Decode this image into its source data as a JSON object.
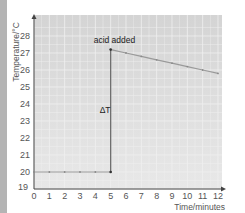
{
  "chart_data": {
    "type": "line",
    "title": "",
    "xlabel": "Time/minutes",
    "ylabel": "Temperature/°C",
    "xlim": [
      0,
      12
    ],
    "ylim": [
      19,
      28
    ],
    "x_ticks": [
      "0",
      "1",
      "2",
      "3",
      "4",
      "5",
      "6",
      "7",
      "8",
      "9",
      "10",
      "11",
      "12"
    ],
    "y_ticks": [
      "19",
      "20",
      "21",
      "22",
      "23",
      "24",
      "25",
      "26",
      "27",
      "28"
    ],
    "grid": true,
    "legend": null,
    "series": [
      {
        "name": "Temperature",
        "x": [
          0,
          1,
          2,
          3,
          4,
          5,
          5,
          6,
          7,
          8,
          9,
          10,
          11,
          12
        ],
        "y": [
          20,
          20,
          20,
          20,
          20,
          20,
          27.2,
          27.0,
          26.8,
          26.6,
          26.4,
          26.2,
          26.0,
          25.8
        ]
      }
    ],
    "annotations": [
      {
        "text": "acid added",
        "x": 5,
        "y": 27.6
      },
      {
        "text": "ΔT",
        "x": 4.6,
        "y": 23.5,
        "note": "vertical double arrow from 20 to 27.2 at t=5"
      }
    ]
  },
  "colors": {
    "plot_bg": "#dcdcdc",
    "grid": "#f0f0f0",
    "line": "#9a9a9a",
    "axis": "#444444",
    "marker": "#333333",
    "side_strip": "#b4b4b4"
  }
}
